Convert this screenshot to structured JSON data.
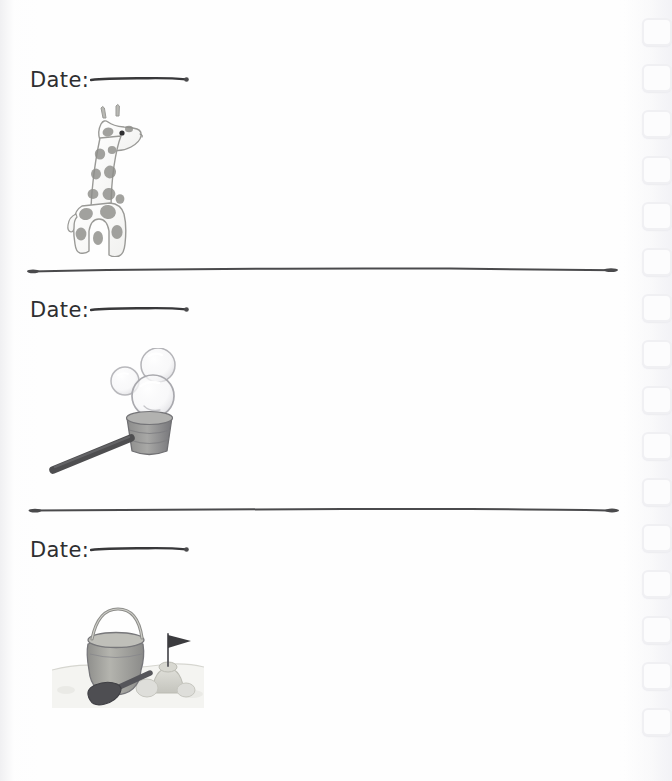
{
  "page": {
    "kind": "journal-page",
    "width": 672,
    "height": 781,
    "background_color": "#fefefe",
    "ink_color": "#2e2e30",
    "rule_color": "#4a4a4c",
    "paper_edge_color": "#eeeef1"
  },
  "binding": {
    "name": "spiral-punch-holes",
    "hole_count": 16,
    "hole_color": "#f0f0f3",
    "hole_fill": "#fcfcfd",
    "first_hole_top": 18,
    "hole_spacing": 46,
    "hole_left": 642
  },
  "entries": [
    {
      "id": "entry-1",
      "date_label": "Date:",
      "date_value": "",
      "date_placeholder": "",
      "illustration": {
        "name": "giraffe-toy-illustration",
        "caption": "wooden giraffe toy",
        "body_color": "#fdfdfd",
        "spot_color": "#8e8e8a",
        "outline_color": "#9a9a97"
      }
    },
    {
      "id": "entry-2",
      "date_label": "Date:",
      "date_value": "",
      "date_placeholder": "",
      "illustration": {
        "name": "bubble-wand-illustration",
        "caption": "bubble blower with soap bubbles",
        "body_color": "#9a9a99",
        "handle_color": "#4e4e50",
        "bubble_color": "#b8b8bb"
      }
    },
    {
      "id": "entry-3",
      "date_label": "Date:",
      "date_value": "",
      "date_placeholder": "",
      "illustration": {
        "name": "sand-bucket-spade-castle-illustration",
        "caption": "sand bucket, spade and sandcastle with flag",
        "bucket_color": "#a9a9a4",
        "spade_color": "#57575a",
        "sand_color": "#cfcfc9",
        "flag_color": "#3b3b3e"
      }
    }
  ],
  "dividers": [
    {
      "name": "entry-divider-1",
      "y": 270,
      "x_start": 30,
      "x_end": 616,
      "color": "#4a4a4c"
    },
    {
      "name": "entry-divider-2",
      "y": 510,
      "x_start": 32,
      "x_end": 617,
      "color": "#4a4a4c"
    }
  ]
}
